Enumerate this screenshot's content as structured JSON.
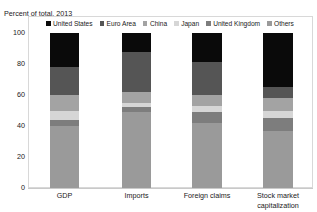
{
  "chart_data": {
    "type": "bar",
    "subtype": "stacked-bar-100",
    "title": "",
    "axis_caption": "Percent of total, 2013",
    "xlabel": "",
    "ylabel": "",
    "ylim": [
      0,
      100
    ],
    "yticks": [
      0,
      20,
      40,
      60,
      80,
      100
    ],
    "ytick_labels": [
      "0",
      "20",
      "40",
      "60",
      "80",
      "100"
    ],
    "grid": false,
    "legend_position": "top",
    "categories": [
      "GDP",
      "Imports",
      "Foreign claims",
      "Stock market capitalization"
    ],
    "series": [
      {
        "name": "United States",
        "color": "#0a0a0a",
        "values": [
          22,
          12,
          19,
          35
        ]
      },
      {
        "name": "Euro Area",
        "color": "#555555",
        "values": [
          18,
          26,
          21,
          7
        ]
      },
      {
        "name": "China",
        "color": "#a3a3a3",
        "values": [
          10,
          7,
          7,
          8
        ]
      },
      {
        "name": "Japan",
        "color": "#d6d6d6",
        "values": [
          6,
          3,
          4,
          5
        ]
      },
      {
        "name": "United Kingdom",
        "color": "#7d7d7d",
        "values": [
          4,
          3,
          7,
          8
        ]
      },
      {
        "name": "Others",
        "color": "#9a9a9a",
        "values": [
          40,
          49,
          42,
          37
        ]
      }
    ],
    "stack_order_bottom_to_top": [
      "Others",
      "United Kingdom",
      "Japan",
      "China",
      "Euro Area",
      "United States"
    ],
    "stacked_segments": {
      "GDP": [
        {
          "name": "Others",
          "start": 0,
          "end": 40
        },
        {
          "name": "United Kingdom",
          "start": 40,
          "end": 44
        },
        {
          "name": "Japan",
          "start": 44,
          "end": 50
        },
        {
          "name": "China",
          "start": 50,
          "end": 60
        },
        {
          "name": "Euro Area",
          "start": 60,
          "end": 78
        },
        {
          "name": "United States",
          "start": 78,
          "end": 100
        }
      ],
      "Imports": [
        {
          "name": "Others",
          "start": 0,
          "end": 49
        },
        {
          "name": "United Kingdom",
          "start": 49,
          "end": 52
        },
        {
          "name": "Japan",
          "start": 52,
          "end": 55
        },
        {
          "name": "China",
          "start": 55,
          "end": 62
        },
        {
          "name": "Euro Area",
          "start": 62,
          "end": 88
        },
        {
          "name": "United States",
          "start": 88,
          "end": 100
        }
      ],
      "Foreign claims": [
        {
          "name": "Others",
          "start": 0,
          "end": 42
        },
        {
          "name": "United Kingdom",
          "start": 42,
          "end": 49
        },
        {
          "name": "Japan",
          "start": 49,
          "end": 53
        },
        {
          "name": "China",
          "start": 53,
          "end": 60
        },
        {
          "name": "Euro Area",
          "start": 60,
          "end": 81
        },
        {
          "name": "United States",
          "start": 81,
          "end": 100
        }
      ],
      "Stock market capitalization": [
        {
          "name": "Others",
          "start": 0,
          "end": 37
        },
        {
          "name": "United Kingdom",
          "start": 37,
          "end": 45
        },
        {
          "name": "Japan",
          "start": 45,
          "end": 50
        },
        {
          "name": "China",
          "start": 50,
          "end": 58
        },
        {
          "name": "Euro Area",
          "start": 58,
          "end": 65
        },
        {
          "name": "United States",
          "start": 65,
          "end": 100
        }
      ]
    }
  },
  "legend": {
    "items": [
      {
        "label": "United States",
        "color": "#0a0a0a"
      },
      {
        "label": "Euro Area",
        "color": "#555555"
      },
      {
        "label": "China",
        "color": "#a3a3a3"
      },
      {
        "label": "Japan",
        "color": "#d6d6d6"
      },
      {
        "label": "United Kingdom",
        "color": "#7d7d7d"
      },
      {
        "label": "Others",
        "color": "#9a9a9a"
      }
    ]
  },
  "colors": {
    "background": "#ffffff",
    "text": "#1a1a1a",
    "frame": "#d8d8d8",
    "baseline": "#c9c9c9"
  }
}
